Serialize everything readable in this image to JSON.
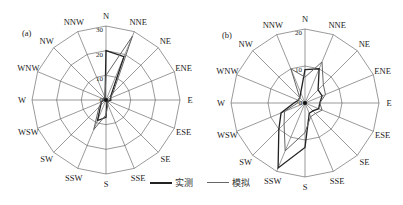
{
  "legend": {
    "measured_label": "实测",
    "simulated_label": "模拟",
    "measured_color": "#222222",
    "simulated_color": "#666666"
  },
  "chart_data": [
    {
      "type": "radar",
      "panel_label": "(a)",
      "categories": [
        "N",
        "NNE",
        "NE",
        "ENE",
        "E",
        "ESE",
        "SE",
        "SSE",
        "S",
        "SSW",
        "SW",
        "WSW",
        "W",
        "WNW",
        "NW",
        "NNW"
      ],
      "rmax": 30,
      "ticks": [
        0,
        10,
        20,
        30
      ],
      "series": [
        {
          "name": "实测",
          "values": [
            20,
            19,
            3,
            2,
            2,
            1,
            1,
            1,
            7,
            9,
            3,
            2,
            1,
            1,
            1,
            1
          ]
        },
        {
          "name": "模拟",
          "values": [
            10,
            28,
            4,
            2,
            1,
            1,
            1,
            2,
            6,
            13,
            4,
            2,
            1,
            1,
            1,
            1
          ]
        }
      ]
    },
    {
      "type": "radar",
      "panel_label": "(b)",
      "categories": [
        "N",
        "NNE",
        "NE",
        "ENE",
        "E",
        "ESE",
        "SE",
        "SSE",
        "S",
        "SSW",
        "SW",
        "WSW",
        "W",
        "WNW",
        "NW",
        "NNW"
      ],
      "rmax": 20,
      "ticks": [
        0,
        10,
        20
      ],
      "series": [
        {
          "name": "实测",
          "values": [
            9,
            10,
            5,
            5,
            4,
            4,
            3,
            3,
            12,
            19,
            10,
            7,
            3,
            2,
            2,
            3
          ]
        },
        {
          "name": "模拟",
          "values": [
            7,
            12,
            7,
            6,
            4,
            5,
            4,
            4,
            8,
            14,
            8,
            6,
            2,
            2,
            2,
            10
          ]
        }
      ]
    }
  ]
}
